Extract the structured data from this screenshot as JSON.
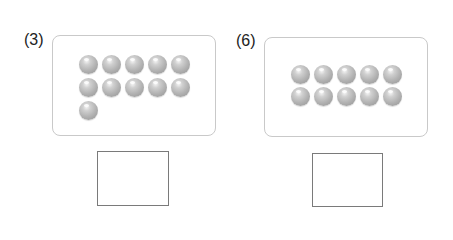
{
  "problems": [
    {
      "label": "(3)",
      "ball_count": 11,
      "rows": [
        5,
        5,
        1
      ],
      "answer": ""
    },
    {
      "label": "(6)",
      "ball_count": 10,
      "rows": [
        5,
        5
      ],
      "answer": ""
    }
  ],
  "colors": {
    "panel_border": "#c9c9c9",
    "ball": "#b3b3b3",
    "answer_border": "#7a7a7a"
  }
}
